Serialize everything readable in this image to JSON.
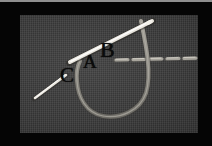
{
  "figure": {
    "frame_color": "#050505",
    "fabric_color": "#3a3a3a",
    "needle_color": "#e8e6df",
    "thread_color": "#8d8b84",
    "label_color": "#0b0b0b"
  },
  "labels": [
    {
      "id": "A",
      "text": "A",
      "x": 63,
      "y": 37
    },
    {
      "id": "B",
      "text": "B",
      "x": 80,
      "y": 24
    },
    {
      "id": "C",
      "text": "C",
      "x": 40,
      "y": 50
    }
  ],
  "elements": {
    "needle": "sewing-needle",
    "thread_loop": "thread-loop",
    "running_stitch": "running-stitch-line",
    "thread_tail": "thread-tail"
  }
}
